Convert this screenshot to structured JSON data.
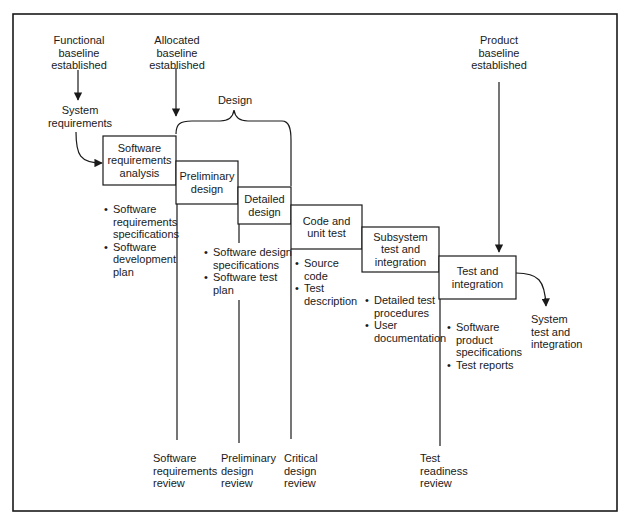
{
  "diagram": {
    "type": "software development waterfall",
    "frame_color": "#1a1a1a",
    "baselines": {
      "functional": "Functional\nbaseline\nestablished",
      "allocated": "Allocated\nbaseline\nestablished",
      "product": "Product\nbaseline\nestablished"
    },
    "inputs": {
      "system_requirements": "System\nrequirements"
    },
    "outputs": {
      "system_test": "System\ntest and\nintegration"
    },
    "design_brace_label": "Design",
    "phases": [
      {
        "id": "sra",
        "label": "Software\nrequirements\nanalysis"
      },
      {
        "id": "pd",
        "label": "Preliminary\ndesign"
      },
      {
        "id": "dd",
        "label": "Detailed\ndesign"
      },
      {
        "id": "cut",
        "label": "Code and\nunit test"
      },
      {
        "id": "sti",
        "label": "Subsystem\ntest and\nintegration"
      },
      {
        "id": "ti",
        "label": "Test and\nintegration"
      }
    ],
    "deliverables": {
      "sra": [
        "Software\nrequirements\nspecifications",
        "Software\ndevelopment\nplan"
      ],
      "dd": [
        "Software design\nspecifications",
        "Software test\nplan"
      ],
      "cut": [
        "Source\ncode",
        "Test\ndescription"
      ],
      "sti": [
        "Detailed test\nprocedures",
        "User\ndocumentation"
      ],
      "ti": [
        "Software\nproduct\nspecifications",
        "Test reports"
      ]
    },
    "reviews": [
      {
        "id": "srr",
        "label": "Software\nrequirements\nreview"
      },
      {
        "id": "pdr",
        "label": "Preliminary\ndesign\nreview"
      },
      {
        "id": "cdr",
        "label": "Critical\ndesign\nreview"
      },
      {
        "id": "trr",
        "label": "Test\nreadiness\nreview"
      }
    ]
  }
}
